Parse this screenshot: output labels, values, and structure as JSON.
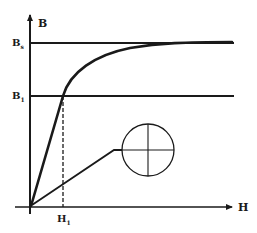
{
  "diagram": {
    "axes": {
      "y_label": "B",
      "x_label": "H"
    },
    "levels": [
      {
        "label": "B",
        "subscript": "s",
        "meaning": "saturation flux density"
      },
      {
        "label": "B",
        "subscript": "1",
        "meaning": "flux density at H1"
      }
    ],
    "x_marks": [
      {
        "label": "H",
        "subscript": "1"
      }
    ],
    "elements": [
      "magnetization-curve",
      "initial-linear-segment",
      "dashed-drop-line",
      "pointer-line",
      "crosshair-circle"
    ],
    "colors": {
      "ink": "#1a1a1a",
      "background": "#ffffff"
    }
  }
}
